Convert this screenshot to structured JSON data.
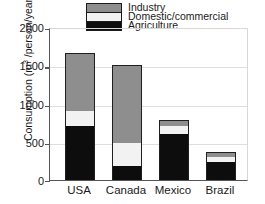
{
  "chart_data": {
    "type": "bar",
    "stacked": true,
    "title": "",
    "xlabel": "",
    "ylabel": "Consumption (m³ /person/year)",
    "ylabel_prefix": "Consumption (m",
    "ylabel_superscript": "3",
    "ylabel_suffix": " /person/year)",
    "categories": [
      "USA",
      "Canada",
      "Mexico",
      "Brazil"
    ],
    "ylim": [
      0,
      2000
    ],
    "yticks": [
      0,
      500,
      1000,
      1500,
      2000
    ],
    "ytick_labels": [
      "0",
      "500",
      "1000",
      "1500",
      "2000"
    ],
    "grid": true,
    "legend_position": "top-center",
    "series": [
      {
        "name": "Agriculture",
        "color": "#0d0d0d",
        "values": [
          700,
          180,
          600,
          240
        ]
      },
      {
        "name": "Domestic/commercial",
        "color": "#f2f2f2",
        "values": [
          200,
          300,
          100,
          60
        ]
      },
      {
        "name": "Industry",
        "color": "#8e8e8e",
        "values": [
          760,
          1020,
          90,
          70
        ]
      }
    ],
    "totals": [
      1660,
      1500,
      790,
      370
    ]
  },
  "legend": {
    "entries": [
      {
        "label": "Industry",
        "color": "#8e8e8e"
      },
      {
        "label": "Domestic/commercial",
        "color": "#f2f2f2"
      },
      {
        "label": "Agriculture",
        "color": "#0d0d0d"
      }
    ]
  },
  "axis": {
    "y_label_text": "Consumption (m",
    "y_label_sup": "3",
    "y_label_tail": " /person/year)",
    "ytick_0": "0",
    "ytick_500": "500",
    "ytick_1000": "1000",
    "ytick_1500": "1500",
    "ytick_2000": "2000"
  },
  "xlabels": {
    "usa": "USA",
    "canada": "Canada",
    "mexico": "Mexico",
    "brazil": "Brazil"
  }
}
